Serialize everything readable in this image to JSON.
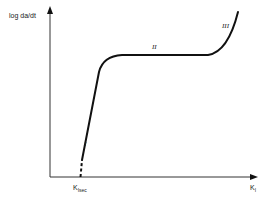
{
  "diagram": {
    "type": "schematic-curve",
    "y_axis": {
      "label": "log da/dt"
    },
    "x_axis": {
      "label_main": "K",
      "label_sub": "I"
    },
    "threshold_marker": {
      "label_main": "K",
      "label_sub": "Isec"
    },
    "regions": [
      {
        "id": "I",
        "label": "I"
      },
      {
        "id": "II",
        "label": "II"
      },
      {
        "id": "III",
        "label": "III"
      }
    ],
    "colors": {
      "line": "#111111",
      "axis": "#333333",
      "background": "#ffffff"
    }
  }
}
